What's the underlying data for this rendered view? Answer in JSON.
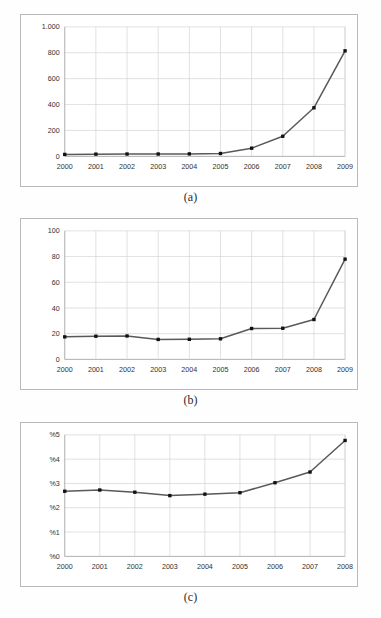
{
  "page": {
    "background_color": "#fefefe",
    "figure_count": 3
  },
  "style": {
    "line_color": "#595959",
    "marker_color": "#111111",
    "grid_color": "#d4d4d4",
    "axis_color": "#9a9a9a",
    "frame_color": "#b9b9b9"
  },
  "figures": [
    {
      "id": "a",
      "caption": "(a)"
    },
    {
      "id": "b",
      "caption": "(b)"
    },
    {
      "id": "c",
      "caption": "(c)"
    }
  ],
  "chart_data": [
    {
      "type": "line",
      "panel": "(a)",
      "title": "",
      "subtitle": "",
      "xlabel": "",
      "ylabel": "",
      "categories": [
        "2000",
        "2001",
        "2002",
        "2003",
        "2004",
        "2005",
        "2006",
        "2007",
        "2008",
        "2009"
      ],
      "values": [
        15,
        17,
        18,
        18,
        19,
        22,
        63,
        155,
        375,
        815
      ],
      "ylim": [
        0,
        1000
      ],
      "yticks": [
        0,
        200,
        400,
        600,
        800,
        1000
      ],
      "ytick_labels": [
        "0",
        "200",
        "400",
        "600",
        "800",
        "1.000"
      ],
      "grid": true,
      "legend": false,
      "legend_position": "none",
      "annotations": []
    },
    {
      "type": "line",
      "panel": "(b)",
      "title": "",
      "subtitle": "",
      "xlabel": "",
      "ylabel": "",
      "categories": [
        "2000",
        "2001",
        "2002",
        "2003",
        "2004",
        "2005",
        "2006",
        "2007",
        "2008",
        "2009"
      ],
      "values": [
        17.5,
        18,
        18.2,
        15.5,
        15.6,
        16,
        24,
        24.2,
        31,
        78
      ],
      "ylim": [
        0,
        100
      ],
      "yticks": [
        0,
        20,
        40,
        60,
        80,
        100
      ],
      "ytick_labels": [
        "0",
        "20",
        "40",
        "60",
        "80",
        "100"
      ],
      "grid": true,
      "legend": false,
      "legend_position": "none",
      "annotations": []
    },
    {
      "type": "line",
      "panel": "(c)",
      "title": "",
      "subtitle": "",
      "xlabel": "",
      "ylabel": "",
      "categories": [
        "2000",
        "2001",
        "2002",
        "2003",
        "2004",
        "2005",
        "2006",
        "2007",
        "2008"
      ],
      "values": [
        2.68,
        2.73,
        2.64,
        2.5,
        2.56,
        2.62,
        3.03,
        3.47,
        4.77
      ],
      "ylim": [
        0,
        5
      ],
      "yticks": [
        0,
        1,
        2,
        3,
        4,
        5
      ],
      "ytick_labels": [
        "%0",
        "%1",
        "%2",
        "%3",
        "%4",
        "%5"
      ],
      "grid": true,
      "legend": false,
      "legend_position": "none",
      "annotations": []
    }
  ]
}
